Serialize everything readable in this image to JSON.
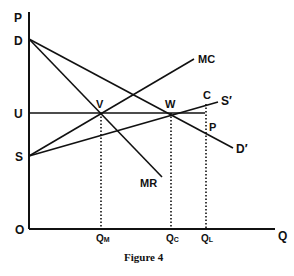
{
  "figure": {
    "caption": "Figure 4",
    "axes": {
      "y_label": "P",
      "x_label": "Q",
      "origin_label": "O"
    },
    "price_labels": {
      "d": "D",
      "u": "U",
      "s": "S"
    },
    "quantity_labels": {
      "qm": "Q",
      "qm_sub": "M",
      "qc": "Q",
      "qc_sub": "C",
      "ql": "Q",
      "ql_sub": "L"
    },
    "curve_labels": {
      "mc": "MC",
      "s_prime": "S′",
      "d_prime": "D′",
      "mr": "MR"
    },
    "point_labels": {
      "v": "V",
      "w": "W",
      "c": "C",
      "p": "P"
    },
    "colors": {
      "ink": "#111111",
      "background": "#ffffff"
    }
  }
}
